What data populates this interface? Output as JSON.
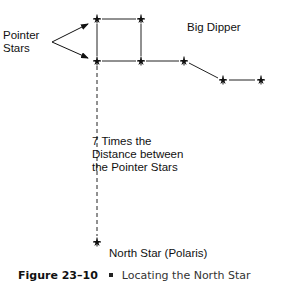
{
  "diagram": {
    "title": "Big Dipper",
    "pointer_label_line1": "Pointer",
    "pointer_label_line2": "Stars",
    "distance_label_line1": "7 Times the",
    "distance_label_line2": "Distance between",
    "distance_label_line3": "the Pointer Stars",
    "north_star_label": "North Star (Polaris)",
    "stars": [
      {
        "name": "pointer-star-top",
        "x": 97,
        "y": 19
      },
      {
        "name": "star-top-right",
        "x": 141,
        "y": 19
      },
      {
        "name": "pointer-star-bottom",
        "x": 97,
        "y": 61
      },
      {
        "name": "star-bottom-right",
        "x": 141,
        "y": 61
      },
      {
        "name": "handle-star-1",
        "x": 184,
        "y": 61
      },
      {
        "name": "handle-star-2",
        "x": 223,
        "y": 80
      },
      {
        "name": "handle-star-3",
        "x": 261,
        "y": 80
      },
      {
        "name": "north-star",
        "x": 97,
        "y": 242
      }
    ]
  },
  "caption": {
    "figure_number": "Figure 23–10",
    "title": "Locating the North Star"
  }
}
